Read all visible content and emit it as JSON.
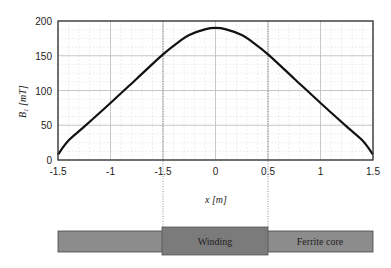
{
  "chart_data": {
    "type": "line",
    "title": "",
    "xlabel": "x [m]",
    "ylabel": "B1 [mT]",
    "xlim": [
      -1.5,
      1.5
    ],
    "ylim": [
      0,
      200
    ],
    "grid": true,
    "x_tick_labels": [
      "-1.5",
      "-1",
      "-1.5",
      "0",
      "0.5",
      "1",
      "1.5"
    ],
    "x_tick_positions": [
      -1.5,
      -1,
      -0.5,
      0,
      0.5,
      1,
      1.5
    ],
    "y_ticks": [
      0,
      50,
      100,
      150,
      200
    ],
    "series": [
      {
        "name": "B1",
        "x": [
          -1.5,
          -1.4,
          -1.25,
          -1.0,
          -0.75,
          -0.5,
          -0.35,
          -0.25,
          -0.1,
          0,
          0.1,
          0.25,
          0.35,
          0.5,
          0.75,
          1.0,
          1.25,
          1.4,
          1.5
        ],
        "values": [
          8,
          28,
          48,
          82,
          117,
          152,
          170,
          180,
          188,
          190,
          188,
          180,
          170,
          152,
          117,
          82,
          48,
          28,
          8
        ]
      }
    ],
    "annotations": {
      "dotted_guides_x": [
        -0.5,
        0.5
      ],
      "bands": [
        {
          "name": "Ferrite core",
          "label": "Ferrite core",
          "x_range": [
            -1.5,
            1.5
          ],
          "color": "#8a8a8a"
        },
        {
          "name": "Winding",
          "label": "Winding",
          "x_range": [
            -0.5,
            0.5
          ],
          "color": "#7a7a7a"
        }
      ]
    }
  },
  "labels": {
    "ylabel_main": "B",
    "ylabel_sub": "1",
    "ylabel_unit": " [mT]",
    "xlabel": "x [m]",
    "winding": "Winding",
    "ferrite": "Ferrite core"
  },
  "colors": {
    "curve": "#111111",
    "frame": "#333333",
    "grid_major": "#bdbdbd",
    "grid_minor": "#dddddd",
    "core": "#8c8c8c",
    "winding": "#7b7b7b"
  }
}
